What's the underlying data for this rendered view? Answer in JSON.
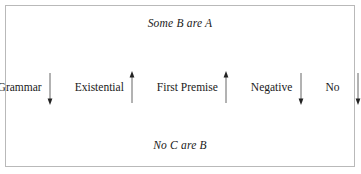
{
  "figure": {
    "border_color": "#b9b9b9",
    "background_color": "#ffffff",
    "text_color": "#1a1a1a"
  },
  "premises": {
    "top": "Some B are A",
    "bottom": "No C are B"
  },
  "features": [
    {
      "label": "Grammar",
      "arrow": "down"
    },
    {
      "label": "Existential",
      "arrow": "up"
    },
    {
      "label": "First Premise",
      "arrow": "up"
    },
    {
      "label": "Negative",
      "arrow": "down"
    },
    {
      "label": "No",
      "arrow": "down"
    }
  ]
}
